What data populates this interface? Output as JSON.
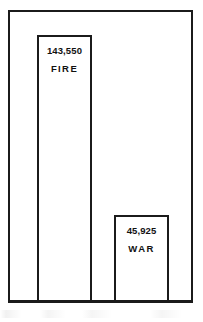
{
  "chart_data": {
    "type": "bar",
    "title": "",
    "subtitle": "",
    "xlabel": "",
    "ylabel": "",
    "categories": [
      "FIRE",
      "WAR"
    ],
    "values": [
      143550,
      45925
    ],
    "value_labels": [
      "143,550",
      "45,925"
    ],
    "ylim": [
      0,
      156000
    ],
    "grid": false,
    "legend": false,
    "legend_position": "none",
    "axis_ticks": [],
    "annotations": [],
    "style": {
      "bar_fill": "#ffffff",
      "bar_stroke": "#1b1b1b",
      "frame_stroke": "#1b1b1b",
      "background": "#ffffff",
      "text_color": "#111111"
    },
    "bars": [
      {
        "name": "fire-bar",
        "category": "FIRE",
        "value": 143550,
        "value_label": "143,550",
        "category_label": "FIRE"
      },
      {
        "name": "war-bar",
        "category": "WAR",
        "value": 45925,
        "value_label": "45,925",
        "category_label": "WAR"
      }
    ]
  }
}
